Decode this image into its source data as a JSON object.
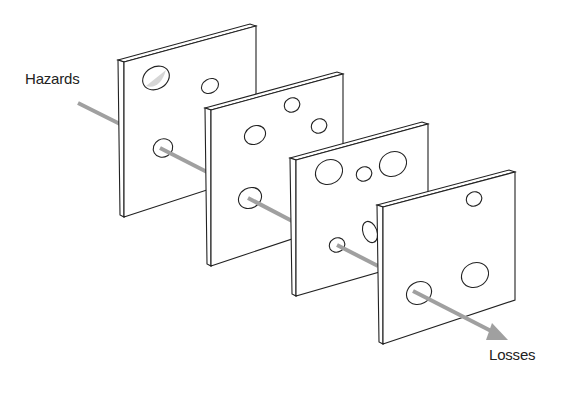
{
  "diagram": {
    "type": "swiss-cheese-model",
    "labels": {
      "input": "Hazards",
      "output": "Losses"
    },
    "slices_count": 4,
    "colors": {
      "outline": "#222222",
      "slice_fill": "#ffffff",
      "arrow": "#9a9a9a",
      "hole_shadow": "#d6d6d6"
    }
  }
}
